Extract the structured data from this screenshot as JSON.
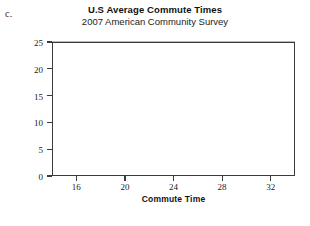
{
  "figure": {
    "part_label": "c."
  },
  "chart_data": {
    "type": "bar",
    "title": "U.S Average Commute Times",
    "subtitle": "2007 American Community Survey",
    "xlabel": "Commute Time",
    "ylabel": "Percent",
    "grid": true,
    "legend": "none",
    "xlim": [
      14,
      34
    ],
    "ylim": [
      0,
      25
    ],
    "bin_width": 2,
    "xticks": [
      16,
      20,
      24,
      28,
      32
    ],
    "xtick_labels": [
      "16",
      "20",
      "24",
      "28",
      "32"
    ],
    "yticks": [
      0,
      5,
      10,
      15,
      20,
      25
    ],
    "ytick_labels": [
      "0",
      "5",
      "10",
      "15",
      "20",
      "25"
    ],
    "bins": [
      {
        "start": 14,
        "end": 16,
        "center": 15,
        "value": 5
      },
      {
        "start": 16,
        "end": 18,
        "center": 17,
        "value": 12
      },
      {
        "start": 18,
        "end": 20,
        "center": 19,
        "value": 5
      },
      {
        "start": 20,
        "end": 22,
        "center": 21,
        "value": 22
      },
      {
        "start": 22,
        "end": 24,
        "center": 23,
        "value": 24.8
      },
      {
        "start": 24,
        "end": 26,
        "center": 25,
        "value": 17.5
      },
      {
        "start": 26,
        "end": 28,
        "center": 27,
        "value": 8
      },
      {
        "start": 28,
        "end": 30,
        "center": 29,
        "value": 4.5
      },
      {
        "start": 30,
        "end": 32,
        "center": 31,
        "value": 4.5
      }
    ],
    "categories": [
      "14-16",
      "16-18",
      "18-20",
      "20-22",
      "22-24",
      "24-26",
      "26-28",
      "28-30",
      "30-32"
    ],
    "values": [
      5,
      12,
      5,
      22,
      24.8,
      17.5,
      8,
      4.5,
      4.5
    ],
    "bar_color": "#e3e3e3",
    "bar_edge_color": "#a6a6a6",
    "grid_color": "#b9b9b9",
    "axis_color": "#3b3b3b"
  }
}
